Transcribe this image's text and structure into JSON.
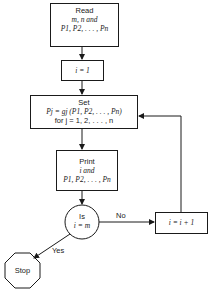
{
  "flowchart": {
    "read_box": {
      "line1": "Read",
      "line2": "m, n and",
      "line3": "P1, P2, . . . , Pn"
    },
    "init_box": {
      "text": "i = 1"
    },
    "set_box": {
      "line1": "Set",
      "line2": "Pj = gj (P1, P2, . . . , Pn)",
      "line3": "for j = 1, 2, . . . , n"
    },
    "print_box": {
      "line1": "Print",
      "line2": "i and",
      "line3": "P1, P2, . . . , Pn"
    },
    "decision": {
      "line1": "Is",
      "line2": "i = m"
    },
    "increment_box": {
      "text": "i = i + 1"
    },
    "stop": {
      "text": "Stop"
    },
    "edge_labels": {
      "no": "No",
      "yes": "Yes"
    }
  }
}
